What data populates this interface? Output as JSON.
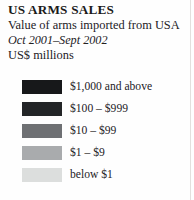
{
  "header": {
    "title": "US ARMS SALES",
    "subtitle": "Value of arms imported from USA",
    "date_range": "Oct 2001–Sept 2002",
    "units": "US$ millions"
  },
  "chart_data": {
    "type": "table",
    "title": "US ARMS SALES",
    "subtitle": "Value of arms imported from USA",
    "annotations": [
      "Oct 2001–Sept 2002",
      "US$ millions"
    ],
    "legend_position": "left",
    "categories": [
      "$1,000 and above",
      "$100 – $999",
      "$10 – $99",
      "$1 – $9",
      "below $1"
    ],
    "colors": [
      "#17181a",
      "#232527",
      "#6e7073",
      "#a9abad",
      "#dcdedd"
    ]
  },
  "legend": {
    "items": [
      {
        "label": "$1,000 and above",
        "color": "#17181a"
      },
      {
        "label": "$100 – $999",
        "color": "#232527"
      },
      {
        "label": "$10 – $99",
        "color": "#6e7073"
      },
      {
        "label": "$1 – $9",
        "color": "#a9abad"
      },
      {
        "label": "below $1",
        "color": "#dcdedd"
      }
    ]
  }
}
